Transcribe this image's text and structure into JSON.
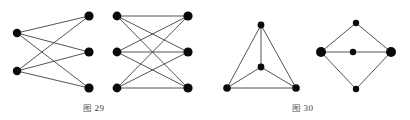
{
  "page": {
    "background_color": "#ffffff",
    "width": 410,
    "height": 120
  },
  "style": {
    "edge_color": "#3f3f3f",
    "node_color": "#0a0a0a",
    "edge_width": 0.9
  },
  "captions": [
    {
      "id": "fig29",
      "prefix": "图",
      "number": "29",
      "text": "图 29"
    },
    {
      "id": "fig30",
      "prefix": "图",
      "number": "30",
      "text": "图 30"
    }
  ],
  "chart_data": {
    "type": "diagram",
    "subtype": "graph-theory-figures",
    "title": "",
    "figures": [
      {
        "label": "图 29",
        "graphs": [
          {
            "name": "complete-bipartite-k23",
            "notation": "K2,3",
            "node_count": 5,
            "edge_count": 6,
            "nodes": [
              {
                "id": "L1",
                "x": 17,
                "y": 33,
                "r": 4.2,
                "part": "left"
              },
              {
                "id": "L2",
                "x": 17,
                "y": 71,
                "r": 4.2,
                "part": "left"
              },
              {
                "id": "R1",
                "x": 89,
                "y": 16,
                "r": 4.6,
                "part": "right"
              },
              {
                "id": "R2",
                "x": 89,
                "y": 52,
                "r": 4.6,
                "part": "right"
              },
              {
                "id": "R3",
                "x": 89,
                "y": 88,
                "r": 4.6,
                "part": "right"
              }
            ],
            "edges": [
              [
                "L1",
                "R1"
              ],
              [
                "L1",
                "R2"
              ],
              [
                "L1",
                "R3"
              ],
              [
                "L2",
                "R1"
              ],
              [
                "L2",
                "R2"
              ],
              [
                "L2",
                "R3"
              ]
            ]
          },
          {
            "name": "complete-bipartite-k33",
            "notation": "K3,3",
            "node_count": 6,
            "edge_count": 9,
            "nodes": [
              {
                "id": "A1",
                "x": 117,
                "y": 16,
                "r": 4.4,
                "part": "left"
              },
              {
                "id": "A2",
                "x": 117,
                "y": 52,
                "r": 4.4,
                "part": "left"
              },
              {
                "id": "A3",
                "x": 117,
                "y": 88,
                "r": 4.4,
                "part": "left"
              },
              {
                "id": "B1",
                "x": 188,
                "y": 16,
                "r": 4.6,
                "part": "right"
              },
              {
                "id": "B2",
                "x": 188,
                "y": 52,
                "r": 4.6,
                "part": "right"
              },
              {
                "id": "B3",
                "x": 188,
                "y": 88,
                "r": 4.6,
                "part": "right"
              }
            ],
            "edges": [
              [
                "A1",
                "B1"
              ],
              [
                "A1",
                "B2"
              ],
              [
                "A1",
                "B3"
              ],
              [
                "A2",
                "B1"
              ],
              [
                "A2",
                "B2"
              ],
              [
                "A2",
                "B3"
              ],
              [
                "A3",
                "B1"
              ],
              [
                "A3",
                "B2"
              ],
              [
                "A3",
                "B3"
              ]
            ]
          }
        ]
      },
      {
        "label": "图 30",
        "graphs": [
          {
            "name": "complete-graph-k4-planar",
            "notation": "K4",
            "node_count": 4,
            "edge_count": 6,
            "nodes": [
              {
                "id": "T",
                "x": 261,
                "y": 25,
                "r": 3.4,
                "part": "apex"
              },
              {
                "id": "C",
                "x": 261,
                "y": 67,
                "r": 3.4,
                "part": "center"
              },
              {
                "id": "BL",
                "x": 227,
                "y": 88,
                "r": 3.8,
                "part": "base-left"
              },
              {
                "id": "BR",
                "x": 296,
                "y": 88,
                "r": 3.8,
                "part": "base-right"
              }
            ],
            "edges": [
              [
                "T",
                "BL"
              ],
              [
                "T",
                "BR"
              ],
              [
                "T",
                "C"
              ],
              [
                "BL",
                "BR"
              ],
              [
                "BL",
                "C"
              ],
              [
                "BR",
                "C"
              ]
            ]
          },
          {
            "name": "diamond-with-center-vertex",
            "notation": "",
            "node_count": 5,
            "edge_count": 6,
            "nodes": [
              {
                "id": "D_T",
                "x": 356,
                "y": 23,
                "r": 3.2,
                "part": "top"
              },
              {
                "id": "D_L",
                "x": 321,
                "y": 52,
                "r": 5.0,
                "part": "left"
              },
              {
                "id": "D_M",
                "x": 353,
                "y": 52,
                "r": 3.2,
                "part": "middle"
              },
              {
                "id": "D_R",
                "x": 391,
                "y": 52,
                "r": 5.0,
                "part": "right"
              },
              {
                "id": "D_B",
                "x": 356,
                "y": 89,
                "r": 3.2,
                "part": "bottom"
              }
            ],
            "edges": [
              [
                "D_T",
                "D_L"
              ],
              [
                "D_T",
                "D_R"
              ],
              [
                "D_B",
                "D_L"
              ],
              [
                "D_B",
                "D_R"
              ],
              [
                "D_L",
                "D_M"
              ],
              [
                "D_M",
                "D_R"
              ]
            ]
          }
        ]
      }
    ]
  }
}
